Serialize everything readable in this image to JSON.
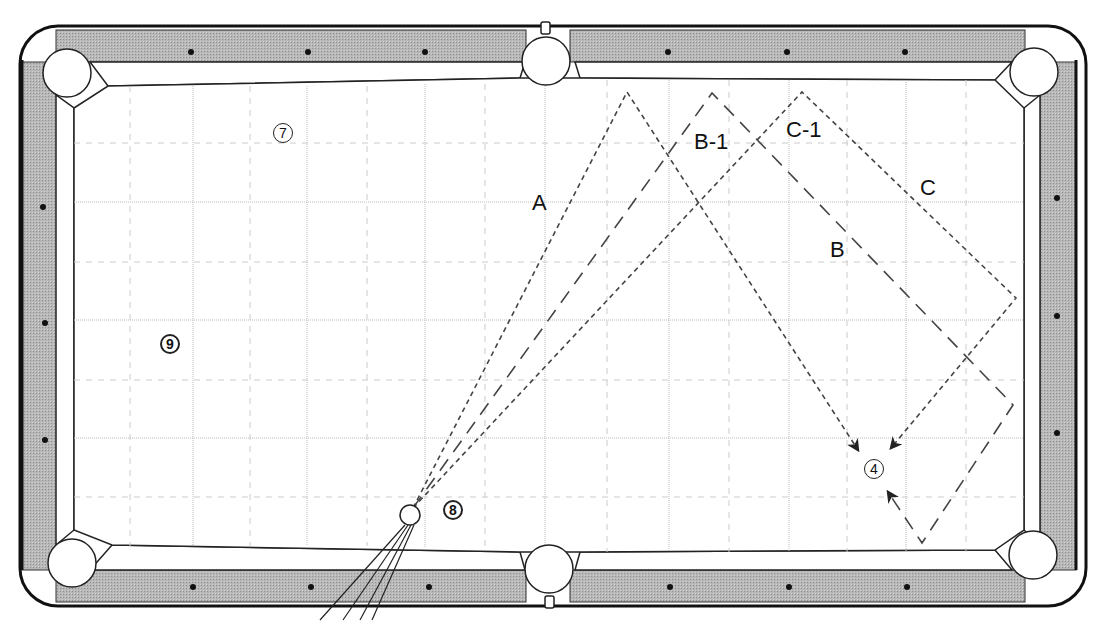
{
  "diagram": {
    "type": "billiards-table-shot-diagram",
    "colors": {
      "rail": "#b3b3b3",
      "outline": "#222222",
      "cloth": "#ffffff",
      "grid": "#bbbbbb",
      "path": "#444444"
    },
    "balls": [
      {
        "id": "7",
        "label": "⑦",
        "x": 283,
        "y": 133
      },
      {
        "id": "9",
        "label": "9",
        "x": 170,
        "y": 345
      },
      {
        "id": "8",
        "label": "8",
        "x": 455,
        "y": 512
      },
      {
        "id": "4",
        "label": "④",
        "x": 875,
        "y": 470
      },
      {
        "id": "cue",
        "label": "",
        "x": 410,
        "y": 515
      }
    ],
    "path_labels": {
      "A": "A",
      "B": "B",
      "B1": "B-1",
      "C": "C",
      "C1": "C-1"
    }
  }
}
